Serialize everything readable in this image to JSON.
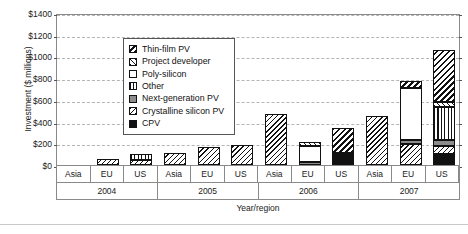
{
  "chart_data": {
    "type": "bar",
    "subtype": "stacked-grouped",
    "title": "",
    "xlabel": "Year/region",
    "ylabel": "Investment ($ millions)",
    "ylim": [
      0,
      1400
    ],
    "ytick_step": 200,
    "ytick_labels": [
      "$0",
      "$200",
      "$400",
      "$600",
      "$800",
      "$1000",
      "$1200",
      "$1400"
    ],
    "ytick_values": [
      0,
      200,
      400,
      600,
      800,
      1000,
      1200,
      1400
    ],
    "grid": true,
    "grid_axis": "y",
    "legend_position": "upper-left-inside",
    "groups": [
      "2004",
      "2005",
      "2006",
      "2007"
    ],
    "regions": [
      "Asia",
      "EU",
      "US"
    ],
    "categories": [
      "2004 Asia",
      "2004 EU",
      "2004 US",
      "2005 Asia",
      "2005 EU",
      "2005 US",
      "2006 Asia",
      "2006 EU",
      "2006 US",
      "2007 Asia",
      "2007 EU",
      "2007 US"
    ],
    "series": [
      {
        "name": "Thin-film PV",
        "pattern": "diagonal-hatch-wide-backslash",
        "color": "#ffffff",
        "values": [
          0,
          0,
          0,
          0,
          0,
          0,
          0,
          0,
          230,
          0,
          60,
          480
        ]
      },
      {
        "name": "Project developer",
        "pattern": "diagonal-hatch-slash",
        "color": "#ffffff",
        "values": [
          0,
          0,
          0,
          0,
          0,
          0,
          0,
          40,
          0,
          0,
          0,
          50
        ]
      },
      {
        "name": "Poly-silicon",
        "pattern": "solid-white",
        "color": "#ffffff",
        "values": [
          0,
          0,
          0,
          0,
          0,
          0,
          0,
          150,
          0,
          0,
          480,
          0
        ]
      },
      {
        "name": "Other",
        "pattern": "vertical-lines",
        "color": "#ffffff",
        "values": [
          0,
          0,
          55,
          0,
          0,
          0,
          0,
          0,
          0,
          0,
          0,
          300
        ]
      },
      {
        "name": "Next-generation PV",
        "pattern": "solid-gray",
        "color": "#8c8c8c",
        "values": [
          0,
          0,
          0,
          0,
          0,
          0,
          0,
          25,
          0,
          0,
          40,
          55
        ]
      },
      {
        "name": "Crystalline silicon PV",
        "pattern": "diagonal-hatch-narrow-backslash",
        "color": "#ffffff",
        "values": [
          0,
          60,
          50,
          110,
          170,
          185,
          470,
          0,
          0,
          450,
          190,
          75
        ]
      },
      {
        "name": "CPV",
        "pattern": "solid-black",
        "color": "#111111",
        "values": [
          0,
          0,
          0,
          0,
          0,
          0,
          0,
          0,
          110,
          0,
          0,
          100
        ]
      }
    ],
    "totals": [
      0,
      60,
      105,
      110,
      170,
      185,
      470,
      215,
      340,
      450,
      770,
      1060
    ]
  },
  "legend": {
    "items": [
      {
        "label": "Thin-film PV"
      },
      {
        "label": "Project developer"
      },
      {
        "label": "Poly-silicon"
      },
      {
        "label": "Other"
      },
      {
        "label": "Next-generation PV"
      },
      {
        "label": "Crystalline silicon PV"
      },
      {
        "label": "CPV"
      }
    ]
  }
}
